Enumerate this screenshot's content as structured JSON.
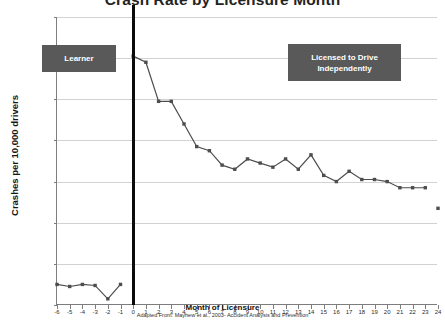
{
  "chart_data": {
    "type": "line",
    "title": "Crash Rate by Licensure Month",
    "xlabel": "Month of Licensure",
    "ylabel": "Crashes per 10,000 drivers",
    "source_note": "Adapted From: Mayhew et al., 2003- Accident Analysis and Prevention",
    "xlim": [
      -6,
      24
    ],
    "ylim": [
      0,
      140
    ],
    "ytick_step": 20,
    "yticks": [
      0,
      20,
      40,
      60,
      80,
      100,
      120,
      140
    ],
    "xticks": [
      -6,
      -5,
      -4,
      -3,
      -2,
      -1,
      0,
      1,
      2,
      3,
      4,
      5,
      6,
      7,
      8,
      9,
      10,
      11,
      12,
      13,
      14,
      15,
      16,
      17,
      18,
      19,
      20,
      21,
      22,
      23,
      24
    ],
    "grid": "horizontal",
    "legend": "none",
    "series": [
      {
        "name": "learner-period",
        "x": [
          -6,
          -5,
          -4,
          -3,
          -2,
          -1
        ],
        "values": [
          10,
          9,
          10,
          9.5,
          3,
          10
        ]
      },
      {
        "name": "licensed-period",
        "x": [
          0,
          1,
          2,
          3,
          4,
          5,
          6,
          7,
          8,
          9,
          10,
          11,
          12,
          13,
          14,
          15,
          16,
          17,
          18,
          19,
          20,
          21,
          22,
          23
        ],
        "values": [
          121,
          118,
          99,
          99,
          88,
          77,
          75,
          68,
          66,
          71,
          69,
          67,
          71,
          66,
          73,
          63,
          60,
          65,
          61,
          61,
          60,
          57,
          57,
          57
        ]
      },
      {
        "name": "terminal-point",
        "x": [
          24
        ],
        "values": [
          47
        ]
      }
    ],
    "annotations": [
      {
        "id": "learner",
        "label": "Learner"
      },
      {
        "id": "licensed",
        "label": "Licensed to Drive Independently",
        "line1": "Licensed to Drive",
        "line2": "Independently"
      }
    ],
    "phase_divider": {
      "x": 0
    },
    "colors": {
      "series": "#4d4d4d",
      "callout_bg": "#595959",
      "callout_text": "#ffffff",
      "grid": "#d2d2d2",
      "axis": "#7d7d7d",
      "divider": "#0b0b0b",
      "title": "#232323"
    }
  }
}
